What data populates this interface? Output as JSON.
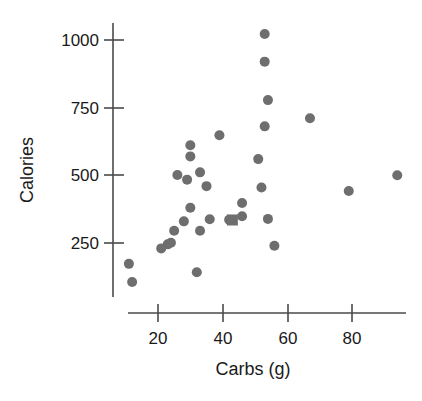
{
  "chart_data": {
    "type": "scatter",
    "title": "",
    "xlabel": "Carbs (g)",
    "ylabel": "Calories",
    "xlim": [
      9,
      97
    ],
    "ylim": [
      80,
      1060
    ],
    "grid": false,
    "legend": null,
    "xticks": [
      20,
      40,
      60,
      80
    ],
    "yticks": [
      250,
      500,
      750,
      1000
    ],
    "xtick_labels": [
      "20",
      "40",
      "60",
      "80"
    ],
    "ytick_labels": [
      "250",
      "500",
      "750",
      "1000"
    ],
    "marker_color": "#6e6e6e",
    "points": [
      {
        "x": 11,
        "y": 173,
        "marker": "circle"
      },
      {
        "x": 12,
        "y": 106,
        "marker": "circle"
      },
      {
        "x": 21,
        "y": 230,
        "marker": "circle"
      },
      {
        "x": 23,
        "y": 245,
        "marker": "circle"
      },
      {
        "x": 24,
        "y": 251,
        "marker": "circle"
      },
      {
        "x": 25,
        "y": 295,
        "marker": "circle"
      },
      {
        "x": 26,
        "y": 501,
        "marker": "circle"
      },
      {
        "x": 28,
        "y": 330,
        "marker": "circle"
      },
      {
        "x": 29,
        "y": 484,
        "marker": "circle"
      },
      {
        "x": 30,
        "y": 611,
        "marker": "circle"
      },
      {
        "x": 30,
        "y": 570,
        "marker": "circle"
      },
      {
        "x": 30,
        "y": 380,
        "marker": "circle"
      },
      {
        "x": 32,
        "y": 142,
        "marker": "circle"
      },
      {
        "x": 33,
        "y": 511,
        "marker": "circle"
      },
      {
        "x": 33,
        "y": 295,
        "marker": "circle"
      },
      {
        "x": 35,
        "y": 460,
        "marker": "circle"
      },
      {
        "x": 36,
        "y": 338,
        "marker": "circle"
      },
      {
        "x": 39,
        "y": 648,
        "marker": "circle"
      },
      {
        "x": 42,
        "y": 336,
        "marker": "circle"
      },
      {
        "x": 43,
        "y": 335,
        "marker": "square"
      },
      {
        "x": 46,
        "y": 398,
        "marker": "circle"
      },
      {
        "x": 46,
        "y": 349,
        "marker": "circle"
      },
      {
        "x": 51,
        "y": 560,
        "marker": "circle"
      },
      {
        "x": 52,
        "y": 455,
        "marker": "circle"
      },
      {
        "x": 53,
        "y": 1022,
        "marker": "circle"
      },
      {
        "x": 53,
        "y": 920,
        "marker": "circle"
      },
      {
        "x": 53,
        "y": 681,
        "marker": "circle"
      },
      {
        "x": 54,
        "y": 778,
        "marker": "circle"
      },
      {
        "x": 54,
        "y": 339,
        "marker": "circle"
      },
      {
        "x": 56,
        "y": 240,
        "marker": "circle"
      },
      {
        "x": 67,
        "y": 711,
        "marker": "circle"
      },
      {
        "x": 79,
        "y": 442,
        "marker": "circle"
      },
      {
        "x": 94,
        "y": 500,
        "marker": "circle"
      }
    ]
  },
  "figure": {
    "y_axis_label": "Calories",
    "x_axis_label": "Carbs (g)",
    "y_tick_1000": "1000",
    "y_tick_750": "750",
    "y_tick_500": "500",
    "y_tick_250": "250",
    "x_tick_20": "20",
    "x_tick_40": "40",
    "x_tick_60": "60",
    "x_tick_80": "80"
  }
}
